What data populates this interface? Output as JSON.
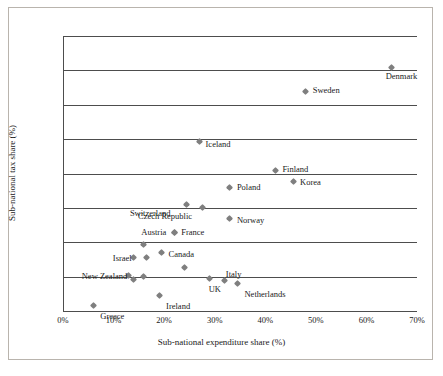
{
  "chart_data": {
    "type": "scatter",
    "title": "",
    "xlabel": "Sub-national expenditure share (%)",
    "ylabel": "Sub-national tax share (%)",
    "xlim": [
      0,
      70
    ],
    "ylim": [
      0,
      40
    ],
    "xticks": [
      "0%",
      "10%",
      "20%",
      "30%",
      "40%",
      "50%",
      "60%",
      "70%"
    ],
    "xtick_values": [
      0,
      10,
      20,
      30,
      40,
      50,
      60,
      70
    ],
    "yticks": [
      "0%",
      "5%",
      "10%",
      "15%",
      "20%",
      "25%",
      "30%",
      "35%",
      "40%"
    ],
    "ytick_values": [
      0,
      5,
      10,
      15,
      20,
      25,
      30,
      35,
      40
    ],
    "grid": "horizontal",
    "legend": "none",
    "marker": "diamond",
    "marker_color": "#7f7f7f",
    "points": [
      {
        "label": "Greece",
        "x": 6.0,
        "y": 0.8,
        "lx": 7,
        "ly": 14,
        "anchor": "left"
      },
      {
        "label": "Ireland",
        "x": 19.0,
        "y": 2.2,
        "lx": 7,
        "ly": 14,
        "anchor": "left"
      },
      {
        "label": "Netherlands",
        "x": 34.5,
        "y": 4.0,
        "lx": 7,
        "ly": 14,
        "anchor": "left"
      },
      {
        "label": "Italy",
        "x": 32.0,
        "y": 4.4,
        "lx": 1,
        "ly": -3,
        "anchor": "left"
      },
      {
        "label": "UK",
        "x": 29.0,
        "y": 4.8,
        "lx": -1,
        "ly": 15,
        "anchor": "left"
      },
      {
        "label": "Israel",
        "x": 14.0,
        "y": 7.8,
        "lx": -21,
        "ly": 5,
        "anchor": "left"
      },
      {
        "label": "New Zealand",
        "x": 13.0,
        "y": 5.2,
        "lx": -47,
        "ly": 5,
        "anchor": "left"
      },
      {
        "label": "Canada",
        "x": 19.5,
        "y": 8.5,
        "lx": 7,
        "ly": 5,
        "anchor": "left"
      },
      {
        "label": "Austria",
        "x": 22.0,
        "y": 11.4,
        "lx": -33,
        "ly": 3,
        "anchor": "left"
      },
      {
        "label": "France",
        "x": 22.0,
        "y": 11.4,
        "lx": 7,
        "ly": 3,
        "anchor": "left"
      },
      {
        "label": "Norway",
        "x": 33.0,
        "y": 13.4,
        "lx": 7,
        "ly": 5,
        "anchor": "left"
      },
      {
        "label": "Czech Republic",
        "x": 27.5,
        "y": 15.0,
        "lx": -64,
        "ly": 12,
        "anchor": "left"
      },
      {
        "label": "Switzerland",
        "x": 24.5,
        "y": 15.5,
        "lx": -57,
        "ly": 13,
        "anchor": "left"
      },
      {
        "label": "Poland",
        "x": 33.0,
        "y": 18.0,
        "lx": 7,
        "ly": 4,
        "anchor": "left"
      },
      {
        "label": "Korea",
        "x": 45.5,
        "y": 18.8,
        "lx": 7,
        "ly": 4,
        "anchor": "left"
      },
      {
        "label": "Finland",
        "x": 42.0,
        "y": 20.5,
        "lx": 7,
        "ly": 3,
        "anchor": "left"
      },
      {
        "label": "Iceland",
        "x": 27.0,
        "y": 24.7,
        "lx": 6,
        "ly": 7,
        "anchor": "left"
      },
      {
        "label": "Sweden",
        "x": 48.0,
        "y": 32.0,
        "lx": 7,
        "ly": 3,
        "anchor": "left"
      },
      {
        "label": "Denmark",
        "x": 65.0,
        "y": 35.4,
        "lx": -6,
        "ly": 12,
        "anchor": "left"
      }
    ],
    "unlabeled_points": [
      {
        "x": 14.0,
        "y": 4.6
      },
      {
        "x": 16.0,
        "y": 5.0
      },
      {
        "x": 16.5,
        "y": 7.8
      },
      {
        "x": 16.0,
        "y": 9.7
      },
      {
        "x": 24.0,
        "y": 6.3
      }
    ]
  }
}
